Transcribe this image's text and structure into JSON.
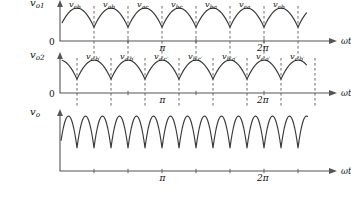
{
  "figure": {
    "type": "waveform-diagram",
    "background": "#ffffff",
    "trace_color": "#3a3a3a",
    "axis_color": "#555555",
    "dash_color": "#444444"
  },
  "plots": [
    {
      "id": "vo1",
      "y_axis_label": "v",
      "y_axis_sub": "o1",
      "zero_label": "0",
      "x_axis_label": "ωt",
      "tick_labels": [
        "π",
        "2π"
      ],
      "segment_labels": [
        "v",
        "v",
        "v",
        "v",
        "v",
        "v",
        "v"
      ],
      "segment_subs": [
        "cb",
        "ab",
        "ac",
        "bc",
        "ba",
        "ca",
        "cb"
      ]
    },
    {
      "id": "vo2",
      "y_axis_label": "v",
      "y_axis_sub": "o2",
      "zero_label": "0",
      "x_axis_label": "ωt",
      "tick_labels": [
        "π",
        "2π"
      ],
      "segment_labels": [
        "v",
        "v",
        "v",
        "v",
        "v",
        "v",
        "v"
      ],
      "segment_subs": [
        "c′b′",
        "a′b′",
        "a′c′",
        "b′c′",
        "b′a′",
        "c′a′",
        "c′b′"
      ]
    },
    {
      "id": "vo",
      "y_axis_label": "v",
      "y_axis_sub": "o",
      "zero_label": "0",
      "x_axis_label": "ωt",
      "tick_labels": [
        "π",
        "2π"
      ],
      "segment_labels": [],
      "segment_subs": []
    }
  ],
  "chart_data": {
    "type": "line",
    "title": "",
    "xlabel": "ωt",
    "ylabel": "",
    "grid": false,
    "legend": "none",
    "xlim": [
      0,
      2.6
    ],
    "x_ticks_pi": [
      1,
      2
    ],
    "x_tick_labels": [
      "π",
      "2π"
    ],
    "series": [
      {
        "name": "v_o1",
        "ylabel": "v_o1",
        "segments_per_pi": 3,
        "segment_labels": [
          "v_cb",
          "v_ab",
          "v_ac",
          "v_bc",
          "v_ba",
          "v_ca",
          "v_cb"
        ],
        "waveform": "piecewise cosine segments, 60 degree conduction, falling ramps",
        "phase_offset_deg": 0
      },
      {
        "name": "v_o2",
        "ylabel": "v_o2",
        "segments_per_pi": 3,
        "segment_labels": [
          "v_c'b'",
          "v_a'b'",
          "v_a'c'",
          "v_b'c'",
          "v_b'a'",
          "v_c'a'",
          "v_c'b'"
        ],
        "waveform": "piecewise cosine segments, 60 degree conduction, phase shifted 30 degrees",
        "phase_offset_deg": 30
      },
      {
        "name": "v_o",
        "ylabel": "v_o",
        "segments_per_pi": 6,
        "segment_labels": [],
        "waveform": "sum ripple, 30 degree conduction, twelve pulse",
        "phase_offset_deg": 0
      }
    ]
  }
}
